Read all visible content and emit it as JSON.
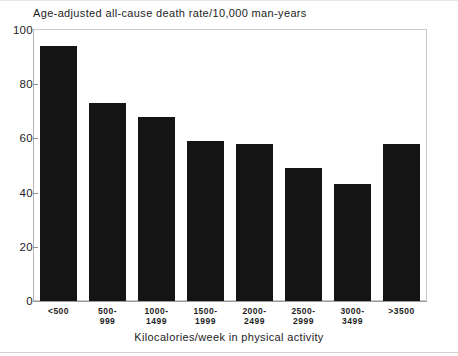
{
  "chart_data": {
    "type": "bar",
    "title": "Age-adjusted all-cause death rate/10,000 man-years",
    "xlabel": "Kilocalories/week in physical activity",
    "ylabel": "",
    "categories": [
      "<500",
      "500-\n999",
      "1000-\n1499",
      "1500-\n1999",
      "2000-\n2499",
      "2500-\n2999",
      "3000-\n3499",
      ">3500"
    ],
    "values": [
      94,
      73,
      68,
      59,
      58,
      49,
      43,
      58
    ],
    "ylim": [
      0,
      100
    ],
    "yticks": [
      0,
      20,
      40,
      60,
      80,
      100
    ],
    "ytick_labels": [
      "0",
      "20",
      "40",
      "60",
      "80",
      "100"
    ],
    "grid": false,
    "legend": "none",
    "bar_color": "#141414",
    "frame_color": "#c9c9c9",
    "background": "#ffffff"
  }
}
